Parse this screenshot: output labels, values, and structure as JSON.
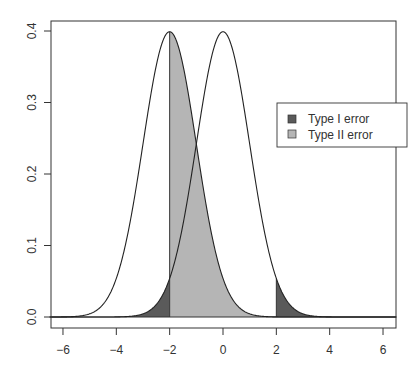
{
  "chart_data": {
    "type": "area",
    "title": "",
    "xlabel": "",
    "ylabel": "",
    "xlim": [
      -6.5,
      6.5
    ],
    "ylim": [
      -0.016,
      0.42
    ],
    "grid": false,
    "x_ticks": [
      -6,
      -4,
      -2,
      0,
      2,
      4,
      6
    ],
    "x_tick_labels": [
      "-6",
      "-4",
      "-2",
      "0",
      "2",
      "4",
      "6"
    ],
    "y_ticks": [
      0.0,
      0.1,
      0.2,
      0.3,
      0.4
    ],
    "y_tick_labels": [
      "0.0",
      "0.1",
      "0.2",
      "0.3",
      "0.4"
    ],
    "series": [
      {
        "name": "Null distribution N(0,1)",
        "type": "line",
        "mean": 0,
        "sd": 1,
        "peak": 0.399
      },
      {
        "name": "Alternative distribution N(-2,1)",
        "type": "line",
        "mean": -2,
        "sd": 1,
        "peak": 0.399
      }
    ],
    "shaded_regions": [
      {
        "name": "Type I error",
        "curve_mean": 0,
        "from": -6.5,
        "to": -2,
        "color": "#5a5a5a"
      },
      {
        "name": "Type I error",
        "curve_mean": 0,
        "from": 2,
        "to": 6.5,
        "color": "#5a5a5a"
      },
      {
        "name": "Type II error",
        "curve_mean": -2,
        "from": -2,
        "to": 2,
        "color": "#b5b5b5"
      }
    ],
    "reference_lines": {
      "horizontal": [
        0
      ],
      "vertical_segments": [
        -2,
        2
      ]
    },
    "legend": {
      "position": "right-upper",
      "entries": [
        {
          "label": "Type I error",
          "color": "#5a5a5a"
        },
        {
          "label": "Type II error",
          "color": "#b5b5b5"
        }
      ]
    }
  },
  "legend": {
    "type1_label": "Type I error",
    "type2_label": "Type II error"
  },
  "axes": {
    "x": [
      "-6",
      "-4",
      "-2",
      "0",
      "2",
      "4",
      "6"
    ],
    "y": [
      "0.0",
      "0.1",
      "0.2",
      "0.3",
      "0.4"
    ]
  }
}
